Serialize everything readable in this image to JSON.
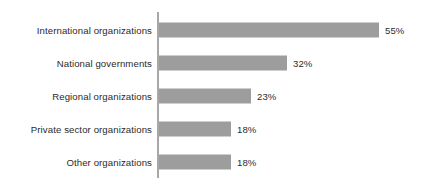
{
  "chart_data": {
    "type": "bar",
    "orientation": "horizontal",
    "title": "",
    "subtitle": "",
    "xlabel": "",
    "ylabel": "",
    "categories": [
      "International organizations",
      "National governments",
      "Regional organizations",
      "Private sector organizations",
      "Other organizations"
    ],
    "values": [
      55,
      32,
      23,
      18,
      18
    ],
    "value_labels": [
      "55%",
      "32%",
      "23%",
      "18%",
      "18%"
    ],
    "units": "percent",
    "xlim": [
      0,
      55
    ],
    "grid": false,
    "legend": null,
    "axis_visible": {
      "category_axis_line": true,
      "value_axis_line": false
    },
    "colors": {
      "bar": "#9d9d9d",
      "axis": "#a8a8a8",
      "text": "#2b2b2b",
      "background": "#ffffff"
    },
    "scale_px_per_unit": 4.0
  }
}
